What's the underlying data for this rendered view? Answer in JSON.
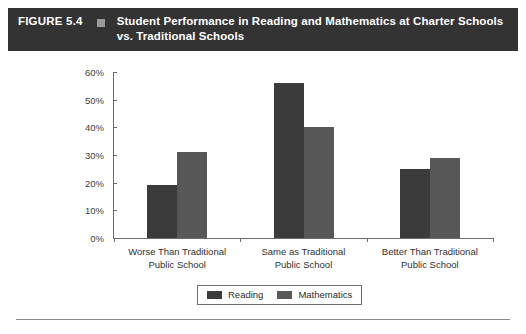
{
  "header": {
    "figure_number": "FIGURE 5.4",
    "marker_icon": "square-bullet-icon",
    "title": "Student Performance in Reading and Mathematics at Charter Schools vs. Traditional Schools",
    "background_color": "#333333",
    "text_color": "#ffffff",
    "marker_color": "#9a9a9a"
  },
  "chart_data": {
    "type": "bar",
    "title": "Student Performance in Reading and Mathematics at Charter Schools vs. Traditional Schools",
    "xlabel": "",
    "ylabel": "",
    "categories": [
      "Worse Than Traditional Public School",
      "Same as Traditional Public School",
      "Better Than Traditional Public School"
    ],
    "category_lines": [
      [
        "Worse Than Traditional",
        "Public School"
      ],
      [
        "Same as Traditional",
        "Public School"
      ],
      [
        "Better Than Traditional",
        "Public School"
      ]
    ],
    "series": [
      {
        "name": "Reading",
        "values": [
          19,
          56,
          25
        ],
        "color": "#3b3b3b"
      },
      {
        "name": "Mathematics",
        "values": [
          31,
          40,
          29
        ],
        "color": "#575757"
      }
    ],
    "ylim": [
      0,
      60
    ],
    "ytick_values": [
      0,
      10,
      20,
      30,
      40,
      50,
      60
    ],
    "ytick_labels": [
      "0%",
      "10%",
      "20%",
      "30%",
      "40%",
      "50%",
      "60%"
    ],
    "grid": false,
    "legend_position": "bottom"
  },
  "legend": {
    "entries": [
      {
        "label": "Reading",
        "color": "#3b3b3b"
      },
      {
        "label": "Mathematics",
        "color": "#575757"
      }
    ]
  }
}
